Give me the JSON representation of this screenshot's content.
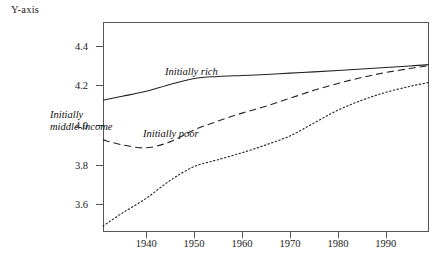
{
  "axis": {
    "y_title": "Y-axis",
    "y_ticks": [
      {
        "label": "4.4",
        "value": 4.4
      },
      {
        "label": "4.2",
        "value": 4.2
      },
      {
        "label": "4.0",
        "value": 4.0
      },
      {
        "label": "3.8",
        "value": 3.8
      },
      {
        "label": "3.6",
        "value": 3.6
      }
    ],
    "x_ticks": [
      {
        "label": "1940",
        "value": 1940
      },
      {
        "label": "1950",
        "value": 1950
      },
      {
        "label": "1960",
        "value": 1960
      },
      {
        "label": "1970",
        "value": 1970
      },
      {
        "label": "1980",
        "value": 1980
      },
      {
        "label": "1990",
        "value": 1990
      }
    ]
  },
  "series_labels": {
    "rich": "Initially rich",
    "middle_line1": "Initially",
    "middle_line2": "middle-income",
    "poor": "Initially poor"
  },
  "colors": {
    "line": "#222222",
    "axis": "#555555",
    "text": "#1a1a1a",
    "background": "#ffffff"
  },
  "chart_data": {
    "type": "line",
    "title": "",
    "xlabel": "",
    "ylabel": "Y-axis",
    "xlim": [
      1931,
      1999
    ],
    "ylim": [
      3.46,
      4.52
    ],
    "grid": false,
    "legend": "inline-annotations",
    "x": [
      1931,
      1935,
      1940,
      1945,
      1950,
      1955,
      1960,
      1965,
      1970,
      1975,
      1980,
      1985,
      1990,
      1995,
      1999
    ],
    "series": [
      {
        "name": "Initially rich",
        "style": "solid",
        "label_text": "Initially rich",
        "values": [
          4.125,
          4.145,
          4.17,
          4.205,
          4.235,
          4.245,
          4.25,
          4.255,
          4.262,
          4.268,
          4.275,
          4.283,
          4.29,
          4.298,
          4.305
        ]
      },
      {
        "name": "Initially middle-income",
        "style": "dashed",
        "label_text": "Initially middle-income",
        "values": [
          3.925,
          3.9,
          3.885,
          3.915,
          3.975,
          4.02,
          4.06,
          4.095,
          4.135,
          4.175,
          4.21,
          4.24,
          4.265,
          4.285,
          4.3
        ]
      },
      {
        "name": "Initially poor",
        "style": "dotted",
        "label_text": "Initially poor",
        "values": [
          3.49,
          3.555,
          3.63,
          3.72,
          3.79,
          3.825,
          3.86,
          3.9,
          3.945,
          4.01,
          4.075,
          4.125,
          4.165,
          4.195,
          4.215
        ]
      }
    ]
  }
}
